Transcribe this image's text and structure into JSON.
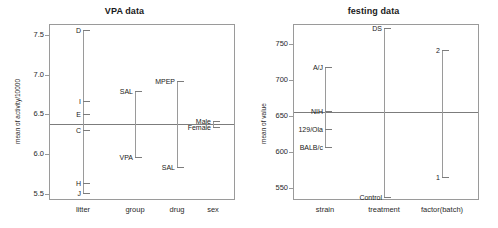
{
  "figure": {
    "panels": [
      "vpa",
      "festing"
    ]
  },
  "chart_data": [
    {
      "type": "scatter",
      "id": "vpa",
      "title": "VPA data",
      "xlabel": "",
      "ylabel": "mean of activity/10000",
      "ylim": [
        5.42,
        7.64
      ],
      "yticks": [
        "5.5",
        "6.0",
        "6.5",
        "7.0",
        "7.5"
      ],
      "ytick_values": [
        5.5,
        6.0,
        6.5,
        7.0,
        7.5
      ],
      "grid": false,
      "legend": "none",
      "grand_mean": 6.38,
      "factors": [
        {
          "name": "litter",
          "levels": [
            {
              "label": "D",
              "value": 7.57
            },
            {
              "label": "I",
              "value": 6.67
            },
            {
              "label": "E",
              "value": 6.5
            },
            {
              "label": "C",
              "value": 6.3
            },
            {
              "label": "H",
              "value": 5.63
            },
            {
              "label": "J",
              "value": 5.51
            }
          ]
        },
        {
          "name": "group",
          "levels": [
            {
              "label": "SAL",
              "value": 6.79
            },
            {
              "label": "VPA",
              "value": 5.96
            }
          ]
        },
        {
          "name": "drug",
          "levels": [
            {
              "label": "MPEP",
              "value": 6.92
            },
            {
              "label": "SAL",
              "value": 5.84
            }
          ]
        },
        {
          "name": "sex",
          "levels": [
            {
              "label": "Male",
              "value": 6.42
            },
            {
              "label": "Female",
              "value": 6.34
            }
          ]
        }
      ]
    },
    {
      "type": "scatter",
      "id": "festing",
      "title": "festing data",
      "xlabel": "",
      "ylabel": "mean of value",
      "ylim": [
        533,
        778
      ],
      "yticks": [
        "550",
        "600",
        "650",
        "700",
        "750"
      ],
      "ytick_values": [
        550,
        600,
        650,
        700,
        750
      ],
      "grid": false,
      "legend": "none",
      "grand_mean": 655,
      "factors": [
        {
          "name": "strain",
          "levels": [
            {
              "label": "A/J",
              "value": 718
            },
            {
              "label": "NIH",
              "value": 657
            },
            {
              "label": "129/Ola",
              "value": 632
            },
            {
              "label": "BALB/c",
              "value": 607
            }
          ]
        },
        {
          "name": "treatment",
          "levels": [
            {
              "label": "DS",
              "value": 772
            },
            {
              "label": "Control",
              "value": 537
            }
          ]
        },
        {
          "name": "factor(batch)",
          "levels": [
            {
              "label": "2",
              "value": 742
            },
            {
              "label": "1",
              "value": 565
            }
          ]
        }
      ]
    }
  ],
  "colors": {
    "axis": "#9a9a9a",
    "line": "#7c7c7c",
    "text": "#1a1a1a",
    "background": "#ffffff"
  }
}
